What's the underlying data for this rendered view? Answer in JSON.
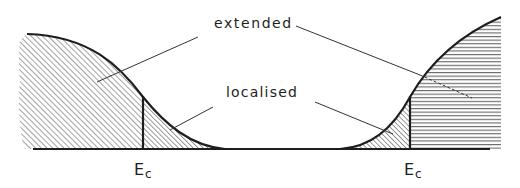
{
  "diagram": {
    "type": "density-of-states schematic",
    "labels": {
      "extended": "extended",
      "localised": "localised",
      "mobility_edge_left": {
        "main": "E",
        "sub": "c"
      },
      "mobility_edge_right": {
        "main": "E",
        "sub": "c"
      }
    },
    "regions": [
      {
        "name": "left-extended",
        "hatch": "diagonal"
      },
      {
        "name": "left-localised",
        "hatch": "diagonal-dense"
      },
      {
        "name": "right-localised",
        "hatch": "diagonal-dense"
      },
      {
        "name": "right-extended",
        "hatch": "horizontal"
      }
    ],
    "colors": {
      "ink": "#1e1e1e",
      "hatch": "#555555",
      "background": "#ffffff"
    }
  }
}
